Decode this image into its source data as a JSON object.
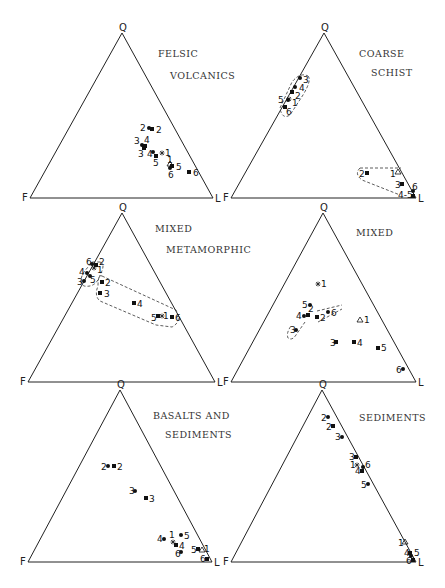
{
  "chart_data": [
    {
      "type": "ternary-scatter",
      "title": [
        "FELSIC",
        "VOLCANICS"
      ],
      "vertices": {
        "top": "Q",
        "left": "F",
        "right": "L"
      },
      "frame": {
        "Q": [
          122,
          33
        ],
        "F": [
          30,
          198
        ],
        "L": [
          213,
          198
        ]
      },
      "title_pos": [
        [
          158,
          57
        ],
        [
          170,
          79
        ]
      ],
      "points": [
        {
          "label": "2",
          "marker": "circle",
          "x": 149,
          "y": 128,
          "lx": 140,
          "ly": 131
        },
        {
          "label": "2",
          "marker": "square",
          "x": 152,
          "y": 129,
          "lx": 156,
          "ly": 133
        },
        {
          "label": "3",
          "marker": "circle",
          "x": 142,
          "y": 145,
          "lx": 134,
          "ly": 144
        },
        {
          "label": "4",
          "marker": "square",
          "x": 145,
          "y": 146,
          "lx": 144,
          "ly": 143
        },
        {
          "label": "3",
          "marker": "square",
          "x": 144,
          "y": 148,
          "lx": 138,
          "ly": 157
        },
        {
          "label": "4",
          "marker": "circle",
          "x": 153,
          "y": 152,
          "lx": 147,
          "ly": 157
        },
        {
          "label": "5",
          "marker": "square",
          "x": 156,
          "y": 156,
          "lx": 153,
          "ly": 166
        },
        {
          "label": "1",
          "marker": "star",
          "x": 162,
          "y": 153,
          "lx": 165,
          "ly": 156
        },
        {
          "label": "1",
          "marker": "triangle",
          "x": 170,
          "y": 164,
          "lx": 167,
          "ly": 163
        },
        {
          "label": "5",
          "marker": "square",
          "x": 172,
          "y": 166,
          "lx": 176,
          "ly": 170
        },
        {
          "label": "6",
          "marker": "circle",
          "x": 170,
          "y": 168,
          "lx": 168,
          "ly": 178
        },
        {
          "label": "6",
          "marker": "square",
          "x": 189,
          "y": 172,
          "lx": 193,
          "ly": 176
        }
      ],
      "envelopes": []
    },
    {
      "type": "ternary-scatter",
      "title": [
        "COARSE",
        "SCHIST"
      ],
      "vertices": {
        "top": "Q",
        "left": "F",
        "right": "L"
      },
      "frame": {
        "Q": [
          324,
          33
        ],
        "F": [
          231,
          198
        ],
        "L": [
          416,
          198
        ]
      },
      "title_pos": [
        [
          359,
          57
        ],
        [
          371,
          76
        ]
      ],
      "points": [
        {
          "label": "3",
          "marker": "circle",
          "x": 300,
          "y": 78,
          "lx": 303,
          "ly": 83
        },
        {
          "label": "4",
          "marker": "circle",
          "x": 295,
          "y": 87,
          "lx": 299,
          "ly": 91
        },
        {
          "label": "2",
          "marker": "square",
          "x": 292,
          "y": 92,
          "lx": 295,
          "ly": 99
        },
        {
          "label": "5",
          "marker": "circle",
          "x": 288,
          "y": 100,
          "lx": 278,
          "ly": 103
        },
        {
          "label": "1",
          "marker": "star",
          "x": 289,
          "y": 99,
          "lx": 292,
          "ly": 106
        },
        {
          "label": "6",
          "marker": "square",
          "x": 285,
          "y": 107,
          "lx": 286,
          "ly": 115
        },
        {
          "label": "2",
          "marker": "square",
          "x": 367,
          "y": 173,
          "lx": 359,
          "ly": 177
        },
        {
          "label": "1",
          "marker": "triangle",
          "x": 398,
          "y": 172,
          "lx": 390,
          "ly": 177
        },
        {
          "label": "3",
          "marker": "square",
          "x": 402,
          "y": 184,
          "lx": 395,
          "ly": 188
        },
        {
          "label": "6",
          "marker": "circle",
          "x": 413,
          "y": 191,
          "lx": 412,
          "ly": 190
        },
        {
          "label": "4-5",
          "marker": "square",
          "x": 413,
          "y": 196,
          "lx": 398,
          "ly": 198
        }
      ],
      "envelopes": [
        "M 308 76 Q 312 80 303 95 L 290 115 Q 282 120 280 108 L 292 82 Q 300 72 308 76 Z",
        "M 360 168 L 401 168 M 360 168 Q 354 174 362 180 L 400 195"
      ]
    },
    {
      "type": "ternary-scatter",
      "title": [
        "MIXED",
        "METAMORPHIC"
      ],
      "vertices": {
        "top": "Q",
        "left": "F",
        "right": "L"
      },
      "frame": {
        "Q": [
          122,
          213
        ],
        "F": [
          28,
          382
        ],
        "L": [
          215,
          382
        ]
      },
      "title_pos": [
        [
          155,
          232
        ],
        [
          166,
          253
        ]
      ],
      "points": [
        {
          "label": "6",
          "marker": "circle",
          "x": 92,
          "y": 264,
          "lx": 86,
          "ly": 265
        },
        {
          "label": "2",
          "marker": "square",
          "x": 96,
          "y": 265,
          "lx": 99,
          "ly": 265
        },
        {
          "label": "1",
          "marker": "star",
          "x": 94,
          "y": 268,
          "lx": 97,
          "ly": 273
        },
        {
          "label": "4",
          "marker": "circle",
          "x": 87,
          "y": 273,
          "lx": 79,
          "ly": 275
        },
        {
          "label": "5",
          "marker": "circle",
          "x": 90,
          "y": 276,
          "lx": 90,
          "ly": 283
        },
        {
          "label": "3",
          "marker": "circle",
          "x": 84,
          "y": 281,
          "lx": 77,
          "ly": 285
        },
        {
          "label": "2",
          "marker": "square",
          "x": 102,
          "y": 282,
          "lx": 105,
          "ly": 286
        },
        {
          "label": "3",
          "marker": "square",
          "x": 100,
          "y": 293,
          "lx": 104,
          "ly": 297
        },
        {
          "label": "4",
          "marker": "square",
          "x": 134,
          "y": 303,
          "lx": 137,
          "ly": 307
        },
        {
          "label": "5",
          "marker": "square",
          "x": 158,
          "y": 316,
          "lx": 151,
          "ly": 321
        },
        {
          "label": "1",
          "marker": "star",
          "x": 162,
          "y": 316,
          "lx": 163,
          "ly": 319
        },
        {
          "label": "6",
          "marker": "square",
          "x": 172,
          "y": 317,
          "lx": 175,
          "ly": 321
        }
      ],
      "envelopes": [
        "M 100 262 Q 106 264 100 275 Q 96 288 84 286 Q 78 282 84 272 L 92 262 Z",
        "M 102 276 L 176 310 Q 182 322 172 327 L 156 325 L 100 301 Q 94 296 98 286 Q 98 274 102 276 Z"
      ]
    },
    {
      "type": "ternary-scatter",
      "title": [
        "MIXED"
      ],
      "vertices": {
        "top": "Q",
        "left": "F",
        "right": "L"
      },
      "frame": {
        "Q": [
          323,
          213
        ],
        "F": [
          231,
          382
        ],
        "L": [
          416,
          382
        ]
      },
      "title_pos": [
        [
          356,
          236
        ]
      ],
      "points": [
        {
          "label": "1",
          "marker": "star",
          "x": 318,
          "y": 284,
          "lx": 321,
          "ly": 287
        },
        {
          "label": "5",
          "marker": "circle",
          "x": 310,
          "y": 305,
          "lx": 302,
          "ly": 308
        },
        {
          "label": "4",
          "marker": "circle",
          "x": 304,
          "y": 316,
          "lx": 296,
          "ly": 319
        },
        {
          "label": "2",
          "marker": "square",
          "x": 308,
          "y": 315,
          "lx": 308,
          "ly": 312
        },
        {
          "label": "2",
          "marker": "square",
          "x": 317,
          "y": 317,
          "lx": 320,
          "ly": 321
        },
        {
          "label": "6",
          "marker": "circle",
          "x": 328,
          "y": 312,
          "lx": 331,
          "ly": 316
        },
        {
          "label": "1",
          "marker": "triangle",
          "x": 360,
          "y": 320,
          "lx": 364,
          "ly": 323
        },
        {
          "label": "3",
          "marker": "circle",
          "x": 296,
          "y": 330,
          "lx": 290,
          "ly": 333
        },
        {
          "label": "3",
          "marker": "square",
          "x": 336,
          "y": 342,
          "lx": 330,
          "ly": 346
        },
        {
          "label": "4",
          "marker": "square",
          "x": 354,
          "y": 342,
          "lx": 357,
          "ly": 346
        },
        {
          "label": "5",
          "marker": "square",
          "x": 378,
          "y": 348,
          "lx": 381,
          "ly": 351
        },
        {
          "label": "6",
          "marker": "circle",
          "x": 403,
          "y": 369,
          "lx": 396,
          "ly": 373
        }
      ],
      "envelopes": [
        "M 305 322 L 296 335 Q 292 341 288 338 Q 286 333 291 326",
        "M 317 311 L 342 305 M 318 322 L 342 309"
      ]
    },
    {
      "type": "ternary-scatter",
      "title": [
        "BASALTS AND",
        "SEDIMENTS"
      ],
      "vertices": {
        "top": "Q",
        "left": "F",
        "right": "L"
      },
      "frame": {
        "Q": [
          120,
          390
        ],
        "F": [
          28,
          562
        ],
        "L": [
          212,
          562
        ]
      },
      "title_pos": [
        [
          153,
          419
        ],
        [
          165,
          438
        ]
      ],
      "points": [
        {
          "label": "2",
          "marker": "circle",
          "x": 108,
          "y": 466,
          "lx": 101,
          "ly": 470
        },
        {
          "label": "2",
          "marker": "square",
          "x": 114,
          "y": 466,
          "lx": 117,
          "ly": 470
        },
        {
          "label": "3",
          "marker": "circle",
          "x": 135,
          "y": 491,
          "lx": 129,
          "ly": 494
        },
        {
          "label": "3",
          "marker": "square",
          "x": 146,
          "y": 498,
          "lx": 149,
          "ly": 502
        },
        {
          "label": "4",
          "marker": "circle",
          "x": 164,
          "y": 539,
          "lx": 157,
          "ly": 542
        },
        {
          "label": "1",
          "marker": "star",
          "x": 173,
          "y": 542,
          "lx": 169,
          "ly": 538
        },
        {
          "label": "5",
          "marker": "circle",
          "x": 181,
          "y": 535,
          "lx": 184,
          "ly": 539
        },
        {
          "label": "4",
          "marker": "square",
          "x": 176,
          "y": 545,
          "lx": 179,
          "ly": 549
        },
        {
          "label": "6",
          "marker": "circle",
          "x": 181,
          "y": 552,
          "lx": 175,
          "ly": 557
        },
        {
          "label": "5",
          "marker": "square",
          "x": 198,
          "y": 549,
          "lx": 191,
          "ly": 553
        },
        {
          "label": "1",
          "marker": "triangle",
          "x": 202,
          "y": 550,
          "lx": 204,
          "ly": 552
        },
        {
          "label": "6",
          "marker": "square",
          "x": 207,
          "y": 559,
          "lx": 200,
          "ly": 562
        }
      ],
      "envelopes": []
    },
    {
      "type": "ternary-scatter",
      "title": [
        "SEDIMENTS"
      ],
      "vertices": {
        "top": "Q",
        "left": "F",
        "right": "L"
      },
      "frame": {
        "Q": [
          322,
          390
        ],
        "F": [
          231,
          562
        ],
        "L": [
          416,
          562
        ]
      },
      "title_pos": [
        [
          359,
          421
        ]
      ],
      "points": [
        {
          "label": "2",
          "marker": "circle",
          "x": 328,
          "y": 417,
          "lx": 321,
          "ly": 421
        },
        {
          "label": "2",
          "marker": "square",
          "x": 333,
          "y": 426,
          "lx": 326,
          "ly": 430
        },
        {
          "label": "3",
          "marker": "circle",
          "x": 342,
          "y": 437,
          "lx": 335,
          "ly": 440
        },
        {
          "label": "3",
          "marker": "square",
          "x": 356,
          "y": 457,
          "lx": 349,
          "ly": 460
        },
        {
          "label": "1",
          "marker": "star",
          "x": 357,
          "y": 465,
          "lx": 350,
          "ly": 468
        },
        {
          "label": "6",
          "marker": "circle",
          "x": 363,
          "y": 467,
          "lx": 365,
          "ly": 468
        },
        {
          "label": "4",
          "marker": "square",
          "x": 362,
          "y": 471,
          "lx": 355,
          "ly": 474
        },
        {
          "label": "5",
          "marker": "circle",
          "x": 368,
          "y": 484,
          "lx": 361,
          "ly": 488
        },
        {
          "label": "1",
          "marker": "triangle",
          "x": 405,
          "y": 542,
          "lx": 398,
          "ly": 546
        },
        {
          "label": "4",
          "marker": "square",
          "x": 410,
          "y": 553,
          "lx": 404,
          "ly": 556
        },
        {
          "label": "5",
          "marker": "circle",
          "x": 411,
          "y": 556,
          "lx": 414,
          "ly": 556
        },
        {
          "label": "6",
          "marker": "square",
          "x": 413,
          "y": 560,
          "lx": 406,
          "ly": 564
        }
      ],
      "envelopes": []
    }
  ]
}
